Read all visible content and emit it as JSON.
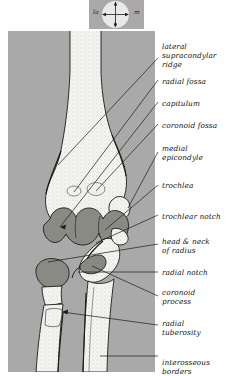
{
  "figure": {
    "view": "anterior view of the elbow joint",
    "background_color": "#a9a9a9",
    "bone_color": "#f4f4f0",
    "shaded_color": "#878782",
    "line_color": "#1b1b16"
  },
  "compass": {
    "name": "orientation-compass",
    "labels": {
      "left": "la",
      "right": "m",
      "bottom": "l"
    }
  },
  "labels": [
    {
      "id": "lateral-supracondylar-ridge",
      "text": "lateral\nsupracondylar\nridge",
      "x": 2,
      "y": 11
    },
    {
      "id": "radial-fossa",
      "text": "radial fossa",
      "x": 2,
      "y": 46
    },
    {
      "id": "capitulum",
      "text": "capitulum",
      "x": 2,
      "y": 68
    },
    {
      "id": "coronoid-fossa",
      "text": "coronoid fossa",
      "x": 2,
      "y": 90
    },
    {
      "id": "medial-epicondyle",
      "text": "medial\nepicondyle",
      "x": 2,
      "y": 113
    },
    {
      "id": "trochlea",
      "text": "trochlea",
      "x": 2,
      "y": 150
    },
    {
      "id": "trochlear-notch",
      "text": "trochlear notch",
      "x": 2,
      "y": 181
    },
    {
      "id": "head-and-neck-of-radius",
      "text": "head & neck\nof radius",
      "x": 2,
      "y": 206
    },
    {
      "id": "radial-notch",
      "text": "radial notch",
      "x": 2,
      "y": 237
    },
    {
      "id": "coronoid-process",
      "text": "coronoid\nprocess",
      "x": 2,
      "y": 257
    },
    {
      "id": "radial-tuberosity",
      "text": "radial\ntuberosity",
      "x": 2,
      "y": 288
    },
    {
      "id": "interosseous-borders",
      "text": "interosseous\nborders",
      "x": 2,
      "y": 327
    }
  ]
}
